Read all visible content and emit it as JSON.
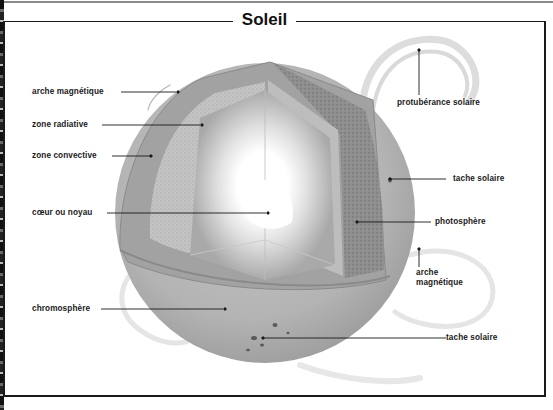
{
  "title": "Soleil",
  "labels": {
    "arche_magnetique_left": "arche magnétique",
    "zone_radiative": "zone radiative",
    "zone_convective": "zone convective",
    "coeur": "cœur ou noyau",
    "chromosphere": "chromosphère",
    "protuberance": "protubérance solaire",
    "tache_solaire_upper": "tache solaire",
    "photosphere": "photosphère",
    "arche_magnetique_right_line1": "arche",
    "arche_magnetique_right_line2": "magnétique",
    "tache_solaire_lower": "tache solaire"
  },
  "colors": {
    "background": "#ffffff",
    "frame": "#1a1a1a",
    "sphere_surface": "#b4b4b4",
    "core_glow": "#ffffff",
    "label_text": "#1a1a1a"
  }
}
